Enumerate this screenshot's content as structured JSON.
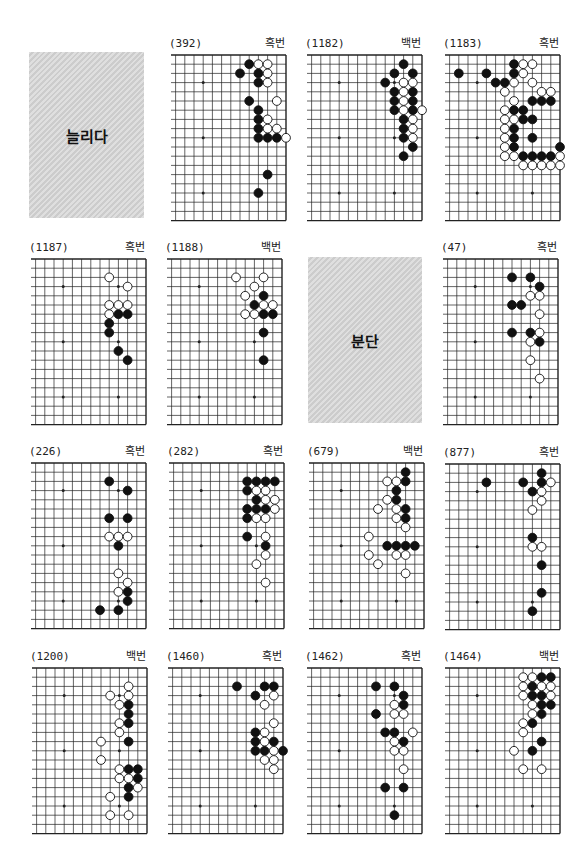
{
  "page": {
    "grid": {
      "spacing": 9.2,
      "first_col": 5.5,
      "cols": 19,
      "rows": 19
    },
    "colors": {
      "black_stone": "#111111",
      "white_stone": "#ffffff",
      "line": "#222222",
      "panel_gray": "#d4d4d4"
    }
  },
  "panels": [
    {
      "type": "title",
      "text": "늘리다",
      "x": 29,
      "y": 52,
      "w": 115,
      "h": 166
    },
    {
      "type": "board",
      "number": "(392)",
      "turn": "흑번",
      "x": 170,
      "y": 54,
      "stones": {
        "black": [
          [
            14,
            1
          ],
          [
            13,
            2
          ],
          [
            15,
            2
          ],
          [
            15,
            3
          ],
          [
            14,
            5
          ],
          [
            15,
            6
          ],
          [
            15,
            7
          ],
          [
            15,
            8
          ],
          [
            15,
            9
          ],
          [
            16,
            9
          ],
          [
            17,
            9
          ],
          [
            16,
            13
          ],
          [
            15,
            15
          ]
        ],
        "white": [
          [
            15,
            1
          ],
          [
            16,
            1
          ],
          [
            16,
            2
          ],
          [
            16,
            3
          ],
          [
            17,
            5
          ],
          [
            16,
            7
          ],
          [
            16,
            8
          ],
          [
            17,
            8
          ],
          [
            18,
            9
          ]
        ]
      }
    },
    {
      "type": "board",
      "number": "(1182)",
      "turn": "백번",
      "x": 306,
      "y": 54,
      "stones": {
        "black": [
          [
            16,
            1
          ],
          [
            15,
            2
          ],
          [
            17,
            2
          ],
          [
            14,
            3
          ],
          [
            15,
            4
          ],
          [
            17,
            4
          ],
          [
            15,
            5
          ],
          [
            17,
            5
          ],
          [
            15,
            6
          ],
          [
            17,
            6
          ],
          [
            16,
            7
          ],
          [
            16,
            8
          ],
          [
            16,
            9
          ],
          [
            17,
            10
          ],
          [
            16,
            11
          ]
        ],
        "white": [
          [
            16,
            3
          ],
          [
            17,
            3
          ],
          [
            16,
            4
          ],
          [
            16,
            5
          ],
          [
            16,
            6
          ],
          [
            18,
            6
          ],
          [
            17,
            7
          ],
          [
            17,
            8
          ],
          [
            17,
            9
          ]
        ]
      }
    },
    {
      "type": "board",
      "number": "(1183)",
      "turn": "흑번",
      "x": 444,
      "y": 54,
      "stones": {
        "black": [
          [
            13,
            1
          ],
          [
            7,
            2
          ],
          [
            10,
            2
          ],
          [
            13,
            2
          ],
          [
            11,
            3
          ],
          [
            12,
            3
          ],
          [
            15,
            5
          ],
          [
            16,
            5
          ],
          [
            17,
            5
          ],
          [
            13,
            6
          ],
          [
            14,
            6
          ],
          [
            14,
            7
          ],
          [
            15,
            7
          ],
          [
            13,
            8
          ],
          [
            13,
            9
          ],
          [
            15,
            9
          ],
          [
            13,
            10
          ],
          [
            18,
            10
          ],
          [
            14,
            11
          ],
          [
            15,
            11
          ],
          [
            16,
            11
          ],
          [
            17,
            11
          ]
        ],
        "white": [
          [
            14,
            1
          ],
          [
            15,
            1
          ],
          [
            14,
            2
          ],
          [
            13,
            3
          ],
          [
            15,
            3
          ],
          [
            12,
            4
          ],
          [
            16,
            4
          ],
          [
            17,
            4
          ],
          [
            13,
            5
          ],
          [
            12,
            6
          ],
          [
            12,
            7
          ],
          [
            13,
            7
          ],
          [
            12,
            8
          ],
          [
            12,
            9
          ],
          [
            12,
            10
          ],
          [
            12,
            11
          ],
          [
            13,
            11
          ],
          [
            18,
            11
          ],
          [
            14,
            12
          ],
          [
            15,
            12
          ],
          [
            16,
            12
          ],
          [
            17,
            12
          ],
          [
            18,
            12
          ]
        ]
      }
    },
    {
      "type": "board",
      "number": "(1187)",
      "turn": "흑번",
      "x": 30,
      "y": 258,
      "stones": {
        "black": [
          [
            15,
            6
          ],
          [
            16,
            6
          ],
          [
            14,
            7
          ],
          [
            14,
            8
          ],
          [
            15,
            10
          ],
          [
            16,
            11
          ]
        ],
        "white": [
          [
            14,
            2
          ],
          [
            16,
            3
          ],
          [
            14,
            5
          ],
          [
            15,
            5
          ],
          [
            16,
            5
          ],
          [
            14,
            6
          ]
        ]
      }
    },
    {
      "type": "board",
      "number": "(1188)",
      "turn": "백번",
      "x": 166,
      "y": 258,
      "stones": {
        "black": [
          [
            16,
            4
          ],
          [
            15,
            5
          ],
          [
            16,
            6
          ],
          [
            17,
            6
          ],
          [
            16,
            8
          ],
          [
            16,
            11
          ]
        ],
        "white": [
          [
            13,
            2
          ],
          [
            16,
            2
          ],
          [
            15,
            3
          ],
          [
            14,
            4
          ],
          [
            16,
            5
          ],
          [
            17,
            5
          ],
          [
            14,
            6
          ],
          [
            15,
            6
          ]
        ]
      }
    },
    {
      "type": "title",
      "text": "분단",
      "x": 308,
      "y": 257,
      "w": 114,
      "h": 166
    },
    {
      "type": "board",
      "number": "(47)",
      "turn": "흑번",
      "x": 442,
      "y": 258,
      "stones": {
        "black": [
          [
            13,
            2
          ],
          [
            15,
            2
          ],
          [
            16,
            3
          ],
          [
            13,
            5
          ],
          [
            14,
            5
          ],
          [
            13,
            8
          ],
          [
            15,
            8
          ],
          [
            16,
            9
          ]
        ],
        "white": [
          [
            15,
            4
          ],
          [
            16,
            4
          ],
          [
            16,
            6
          ],
          [
            16,
            8
          ],
          [
            15,
            9
          ],
          [
            15,
            11
          ],
          [
            16,
            13
          ]
        ]
      }
    },
    {
      "type": "board",
      "number": "(226)",
      "turn": "흑번",
      "x": 30,
      "y": 462,
      "stones": {
        "black": [
          [
            14,
            2
          ],
          [
            16,
            3
          ],
          [
            14,
            6
          ],
          [
            16,
            6
          ],
          [
            15,
            9
          ],
          [
            16,
            14
          ],
          [
            16,
            15
          ],
          [
            13,
            16
          ],
          [
            15,
            16
          ]
        ],
        "white": [
          [
            14,
            8
          ],
          [
            15,
            8
          ],
          [
            16,
            8
          ],
          [
            15,
            12
          ],
          [
            16,
            13
          ],
          [
            15,
            14
          ]
        ]
      }
    },
    {
      "type": "board",
      "number": "(282)",
      "turn": "흑번",
      "x": 168,
      "y": 462,
      "stones": {
        "black": [
          [
            14,
            2
          ],
          [
            15,
            2
          ],
          [
            16,
            2
          ],
          [
            17,
            2
          ],
          [
            14,
            3
          ],
          [
            15,
            4
          ],
          [
            14,
            5
          ],
          [
            15,
            5
          ],
          [
            16,
            5
          ],
          [
            14,
            6
          ],
          [
            14,
            8
          ],
          [
            16,
            9
          ]
        ],
        "white": [
          [
            15,
            3
          ],
          [
            16,
            3
          ],
          [
            16,
            4
          ],
          [
            17,
            4
          ],
          [
            17,
            5
          ],
          [
            15,
            6
          ],
          [
            16,
            6
          ],
          [
            16,
            8
          ],
          [
            16,
            10
          ],
          [
            15,
            11
          ],
          [
            16,
            13
          ]
        ]
      }
    },
    {
      "type": "board",
      "number": "(679)",
      "turn": "백번",
      "x": 308,
      "y": 462,
      "stones": {
        "black": [
          [
            16,
            1
          ],
          [
            16,
            2
          ],
          [
            15,
            3
          ],
          [
            15,
            4
          ],
          [
            16,
            5
          ],
          [
            16,
            6
          ],
          [
            14,
            9
          ],
          [
            15,
            9
          ],
          [
            16,
            9
          ],
          [
            17,
            9
          ]
        ],
        "white": [
          [
            14,
            2
          ],
          [
            15,
            2
          ],
          [
            14,
            4
          ],
          [
            13,
            5
          ],
          [
            15,
            5
          ],
          [
            15,
            6
          ],
          [
            16,
            7
          ],
          [
            12,
            8
          ],
          [
            12,
            10
          ],
          [
            15,
            10
          ],
          [
            16,
            10
          ],
          [
            13,
            11
          ],
          [
            16,
            12
          ]
        ]
      }
    },
    {
      "type": "board",
      "number": "(877)",
      "turn": "흑번",
      "x": 444,
      "y": 463,
      "stones": {
        "black": [
          [
            16,
            1
          ],
          [
            10,
            2
          ],
          [
            14,
            2
          ],
          [
            16,
            2
          ],
          [
            15,
            3
          ],
          [
            15,
            8
          ],
          [
            16,
            11
          ],
          [
            16,
            14
          ],
          [
            15,
            16
          ]
        ],
        "white": [
          [
            17,
            2
          ],
          [
            16,
            3
          ],
          [
            16,
            4
          ],
          [
            15,
            5
          ],
          [
            15,
            9
          ],
          [
            16,
            9
          ]
        ]
      }
    },
    {
      "type": "board",
      "number": "(1200)",
      "turn": "백번",
      "x": 31,
      "y": 667,
      "stones": {
        "black": [
          [
            16,
            4
          ],
          [
            16,
            5
          ],
          [
            16,
            6
          ],
          [
            16,
            8
          ],
          [
            16,
            11
          ],
          [
            17,
            11
          ],
          [
            17,
            12
          ],
          [
            16,
            13
          ],
          [
            16,
            14
          ]
        ],
        "white": [
          [
            16,
            2
          ],
          [
            14,
            3
          ],
          [
            16,
            3
          ],
          [
            15,
            4
          ],
          [
            15,
            6
          ],
          [
            15,
            7
          ],
          [
            13,
            8
          ],
          [
            13,
            10
          ],
          [
            15,
            11
          ],
          [
            15,
            12
          ],
          [
            16,
            12
          ],
          [
            17,
            13
          ],
          [
            14,
            14
          ],
          [
            14,
            16
          ],
          [
            16,
            16
          ]
        ]
      }
    },
    {
      "type": "board",
      "number": "(1460)",
      "turn": "흑번",
      "x": 167,
      "y": 667,
      "stones": {
        "black": [
          [
            13,
            2
          ],
          [
            16,
            2
          ],
          [
            17,
            2
          ],
          [
            15,
            3
          ],
          [
            15,
            7
          ],
          [
            15,
            8
          ],
          [
            17,
            8
          ],
          [
            15,
            9
          ],
          [
            16,
            9
          ],
          [
            18,
            9
          ]
        ],
        "white": [
          [
            17,
            3
          ],
          [
            16,
            4
          ],
          [
            17,
            6
          ],
          [
            16,
            7
          ],
          [
            16,
            8
          ],
          [
            17,
            9
          ],
          [
            16,
            10
          ],
          [
            17,
            10
          ],
          [
            17,
            11
          ]
        ]
      }
    },
    {
      "type": "board",
      "number": "(1462)",
      "turn": "흑번",
      "x": 306,
      "y": 667,
      "stones": {
        "black": [
          [
            13,
            2
          ],
          [
            15,
            2
          ],
          [
            16,
            3
          ],
          [
            16,
            4
          ],
          [
            13,
            5
          ],
          [
            14,
            7
          ],
          [
            15,
            7
          ],
          [
            16,
            8
          ],
          [
            14,
            13
          ],
          [
            16,
            13
          ],
          [
            15,
            16
          ]
        ],
        "white": [
          [
            15,
            4
          ],
          [
            15,
            5
          ],
          [
            16,
            5
          ],
          [
            17,
            7
          ],
          [
            15,
            8
          ],
          [
            15,
            9
          ],
          [
            16,
            9
          ],
          [
            16,
            11
          ]
        ]
      }
    },
    {
      "type": "board",
      "number": "(1464)",
      "turn": "백번",
      "x": 444,
      "y": 667,
      "stones": {
        "black": [
          [
            16,
            1
          ],
          [
            17,
            1
          ],
          [
            15,
            2
          ],
          [
            15,
            3
          ],
          [
            16,
            3
          ],
          [
            16,
            4
          ],
          [
            17,
            4
          ],
          [
            16,
            5
          ],
          [
            15,
            6
          ],
          [
            16,
            8
          ],
          [
            15,
            9
          ]
        ],
        "white": [
          [
            14,
            1
          ],
          [
            15,
            1
          ],
          [
            14,
            2
          ],
          [
            16,
            2
          ],
          [
            17,
            2
          ],
          [
            14,
            3
          ],
          [
            17,
            3
          ],
          [
            15,
            4
          ],
          [
            15,
            5
          ],
          [
            14,
            6
          ],
          [
            14,
            7
          ],
          [
            13,
            9
          ],
          [
            14,
            11
          ],
          [
            16,
            11
          ]
        ]
      }
    }
  ],
  "star_points": {
    "cols": [
      9,
      15
    ],
    "rows": [
      3,
      9,
      15
    ]
  }
}
